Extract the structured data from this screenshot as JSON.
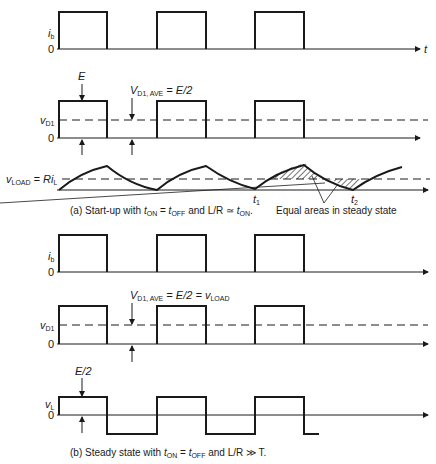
{
  "figure": {
    "part_a": {
      "caption_prefix": "(a) Start-up with ",
      "caption_t1": "t",
      "caption_t1_sub": "ON",
      "caption_eq": " = ",
      "caption_t2": "t",
      "caption_t2_sub": "OFF",
      "caption_mid": " and L/R ≃ ",
      "caption_t3": "t",
      "caption_t3_sub": "ON",
      "caption_end": ".",
      "ib_label": "i",
      "ib_sub": "b",
      "zero": "0",
      "t_axis": "t",
      "E_label": "E",
      "vd1_label": "v",
      "vd1_sub": "D1",
      "vd1ave_label": "V",
      "vd1ave_sub": "D1, AVE",
      "vd1ave_eq": " = E/2",
      "vload_label": "v",
      "vload_sub": "LOAD",
      "vload_eq": " = Ri",
      "vload_eq_sub": "L",
      "t1_label": "t",
      "t1_sub": "1",
      "t2_label": "t",
      "t2_sub": "2",
      "annotation": "Equal areas in steady state"
    },
    "part_b": {
      "caption_prefix": "(b) Steady state with ",
      "caption_t1": "t",
      "caption_t1_sub": "ON",
      "caption_eq": " = ",
      "caption_t2": "t",
      "caption_t2_sub": "OFF",
      "caption_end": " and L/R ≫ T.",
      "ib_label": "i",
      "ib_sub": "b",
      "zero": "0",
      "vd1_label": "v",
      "vd1_sub": "D1",
      "vd1ave_label": "V",
      "vd1ave_sub": "D1, AVE",
      "vd1ave_eq": " = E/2 = v",
      "vd1ave_eq_sub": "LOAD",
      "E2_label": "E/2",
      "vl_label": "v",
      "vl_sub": "L"
    },
    "colors": {
      "ink": "#1a1a1a",
      "background": "#ffffff"
    }
  }
}
